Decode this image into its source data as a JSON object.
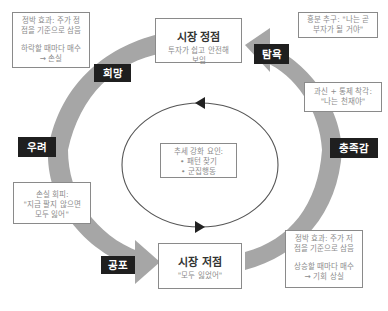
{
  "diagram": {
    "stages": {
      "peak": {
        "title": "시장 정점",
        "subtitle_lines": [
          "투자가 쉽고 안전해",
          "보임"
        ]
      },
      "bottom": {
        "title": "시장 저점",
        "subtitle_lines": [
          "\"모두 잃었어\""
        ]
      }
    },
    "emotions": {
      "hope": "희망",
      "greed": "탐욕",
      "satisfaction": "충족감",
      "worry": "우려",
      "fear": "공포"
    },
    "notes": {
      "top_left": {
        "lines": [
          "정박 효과: 주가 정",
          "점을 기준으로 삼음"
        ],
        "lines2": [
          "하락할 때마다 매수",
          "→ 손실"
        ]
      },
      "top_right": {
        "lines": [
          "흥분 추구: \"나는 곧",
          "부자가 될 거야\""
        ]
      },
      "right_middle": {
        "lines": [
          "과신 + 통제 착각:",
          "\"나는 천재야\""
        ]
      },
      "left_lower": {
        "lines": [
          "손실 회피:",
          "\"지금 팔지 않으면",
          "모두 잃어\""
        ]
      },
      "bottom_right": {
        "lines": [
          "정박 효과: 주가 저",
          "점을 기준으로 삼음"
        ],
        "lines2": [
          "상승할 때마다 매수",
          "→ 기회 상실"
        ]
      }
    },
    "center": {
      "heading": "추세 강화 요인:",
      "items": [
        "• 패턴 찾기",
        "• 군집행동"
      ]
    },
    "colors": {
      "arrow": "#a6a6a6",
      "label_bg": "#1f1f1f",
      "circle": "#555555"
    }
  }
}
